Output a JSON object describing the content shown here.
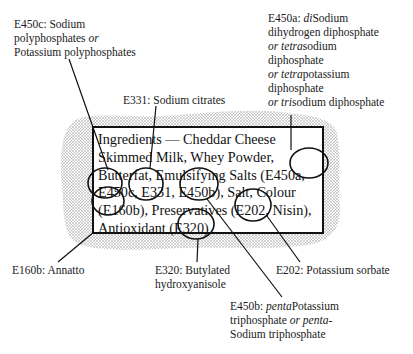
{
  "diagram": {
    "ingredients_label": {
      "lines": [
        "Ingredients — Cheddar Cheese",
        "Skimmed Milk,  Whey Powder,",
        "Butterfat, Emulsifying Salts (E450a,",
        "E450c, E331, E450b), Salt, Colour",
        "(E160b), Preservatives (E202, Nisin),",
        "Antioxidant (E320)"
      ]
    },
    "annotations": [
      {
        "code": "E450c",
        "lines": [
          "E450c: Sodium",
          "polyphosphates |or|",
          "Potassium polyphosphates"
        ]
      },
      {
        "code": "E331",
        "lines": [
          "E331: Sodium citrates"
        ]
      },
      {
        "code": "E450a",
        "lines": [
          "E450a: |di|Sodium",
          "dihydrogen diphosphate",
          "|or tetra|sodium",
          "diphosphate",
          "|or tetra|potassium",
          "diphosphate",
          "|or tri|sodium diphosphate"
        ]
      },
      {
        "code": "E160b",
        "lines": [
          "E160b: Annatto"
        ]
      },
      {
        "code": "E320",
        "lines": [
          "E320: Butylated",
          "hydroxyanisole"
        ]
      },
      {
        "code": "E202",
        "lines": [
          "E202: Potassium sorbate"
        ]
      },
      {
        "code": "E450b",
        "lines": [
          "E450b: |penta|Potassium",
          "triphosphate |or penta-|",
          "Sodium triphosphate"
        ]
      }
    ]
  }
}
